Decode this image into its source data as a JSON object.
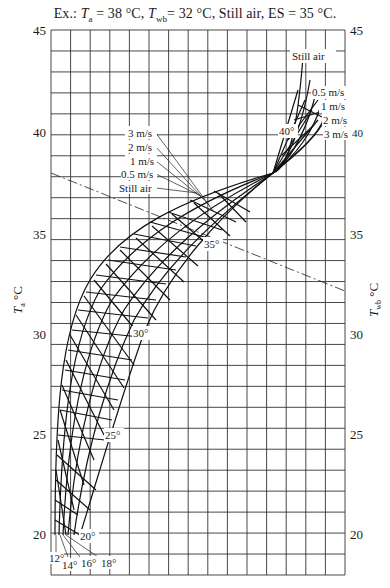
{
  "chart_data": {
    "type": "nomogram",
    "title_parts": {
      "prefix": "Ex.: ",
      "ta_sym": "T",
      "ta_sub": "a",
      "ta_val": " = 38 °C, ",
      "twb_sym": "T",
      "twb_sub": "wb",
      "twb_val": "= 32 °C, Still air, ES = 35 °C."
    },
    "ylabel_left": "Ta °C",
    "ylabel_left_sym": "T",
    "ylabel_left_sub": "a",
    "ylabel_left_unit": " °C",
    "ylabel_right": "Twb °C",
    "ylabel_right_sym": "T",
    "ylabel_right_sub": "wb",
    "ylabel_right_unit": " °C",
    "ylim": [
      19,
      45
    ],
    "yticks_left": [
      20,
      25,
      30,
      35,
      40,
      45
    ],
    "yticks_right": [
      20,
      25,
      30,
      35,
      40,
      45
    ],
    "grid": true,
    "grid_columns": 15,
    "grid_row_step": 1,
    "air_velocity_series": [
      "Still air",
      "0.5 m/s",
      "1 m/s",
      "2 m/s",
      "3 m/s"
    ],
    "air_velocity_labels_upper_right": [
      "Still air",
      "0.5 m/s",
      "1 m/s",
      "2 m/s",
      "3 m/s"
    ],
    "air_velocity_labels_left": [
      "3 m/s",
      "2 m/s",
      "1 m/s",
      "0.5 m/s",
      "Still air"
    ],
    "effective_temperature_labels": [
      "12°",
      "14°",
      "16°",
      "18°",
      "20°",
      "25°",
      "30°",
      "35°",
      "40°"
    ],
    "example_line": {
      "style": "dash-dot",
      "from_Ta": 38,
      "to_Twb": 32,
      "result_ES": 35
    },
    "convergence_point_Ta": 38,
    "right_margin_label": "40"
  },
  "labels": {
    "y45": "45",
    "y40": "40",
    "y35": "35",
    "y30": "30",
    "y25": "25",
    "y20": "20",
    "et12": "12°",
    "et14": "14°",
    "et16": "16°",
    "et18": "18°",
    "et20": "20°",
    "et25": "25°",
    "et30": "30°",
    "et35": "35°",
    "et40": "40°",
    "v_still_top": "Still air",
    "v05_top": "0.5 m/s",
    "v1_top": "1 m/s",
    "v2_top": "2 m/s",
    "v3_top": "3 m/s",
    "v3_left": "3 m/s",
    "v2_left": "2 m/s",
    "v1_left": "1 m/s",
    "v05_left": "0.5 m/s",
    "v_still_left": "Still air",
    "right40": "40"
  }
}
